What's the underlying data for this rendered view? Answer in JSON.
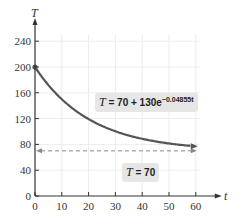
{
  "chart_data": {
    "type": "line",
    "title": "",
    "xlabel": "t",
    "ylabel": "T",
    "xlim": [
      0,
      60
    ],
    "ylim": [
      0,
      240
    ],
    "x_ticks": [
      "0",
      "10",
      "20",
      "30",
      "40",
      "50",
      "60"
    ],
    "y_ticks": [
      "0",
      "40",
      "80",
      "120",
      "160",
      "200",
      "240"
    ],
    "grid": true,
    "series": [
      {
        "name": "T = 70 + 130e^(-0.04855t)",
        "x": [
          0,
          10,
          20,
          30,
          40,
          50,
          60
        ],
        "values": [
          200,
          150.1,
          118.7,
          100.4,
          88.6,
          81.4,
          77.0
        ]
      },
      {
        "name": "T = 70",
        "style": "dashed",
        "x": [
          0,
          60
        ],
        "values": [
          70,
          70
        ]
      }
    ],
    "annotations": [
      {
        "text": "T = 70 + 130e^{-0.04855t}",
        "target": "curve"
      },
      {
        "text": "T = 70",
        "target": "asymptote"
      }
    ],
    "colors": {
      "curve": "#555555",
      "asymptote": "#888888",
      "grid": "#e8e8e8",
      "label_bg": "#e6e6e6"
    }
  },
  "labels": {
    "y_axis": "T",
    "x_axis": "t",
    "eq_curve_lhs": "T",
    "eq_curve_rhs": " = 70 + 130e",
    "eq_curve_exp": "−0.04855t",
    "eq_asym_lhs": "T",
    "eq_asym_rhs": " = 70"
  }
}
